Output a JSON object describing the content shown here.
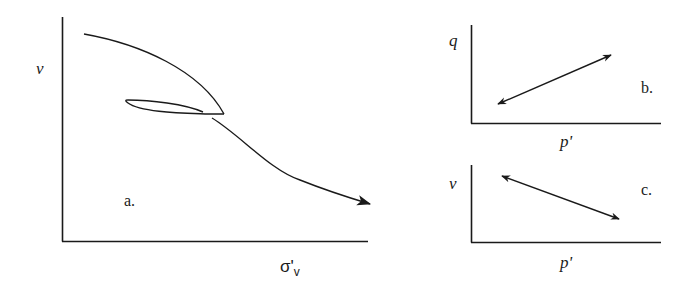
{
  "figure": {
    "panels": [
      {
        "id": "a",
        "tag": "a.",
        "y_label": "ν",
        "x_label_main": "σ'",
        "x_label_sub": "v",
        "description": "Compression curve with unload-reload loop; volume ν decreasing with vertical effective stress σ'v, arrow indicating continued loading"
      },
      {
        "id": "b",
        "tag": "b.",
        "y_label": "q",
        "x_label": "p'",
        "description": "Double-headed arrow with positive slope in q–p' plane"
      },
      {
        "id": "c",
        "tag": "c.",
        "y_label": "ν",
        "x_label": "p'",
        "description": "Double-headed arrow with negative slope in ν–p' plane"
      }
    ],
    "colors": {
      "ink": "#1a1a1a",
      "background": "#ffffff"
    }
  }
}
